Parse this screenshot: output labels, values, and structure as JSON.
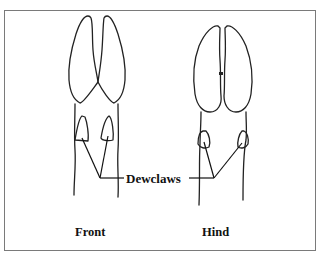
{
  "figure": {
    "callout_label": "Dewclaws",
    "panels": [
      {
        "id": "front",
        "label": "Front"
      },
      {
        "id": "hind",
        "label": "Hind"
      }
    ]
  },
  "colors": {
    "stroke": "#222222",
    "frame": "#7a7a7a",
    "background": "#ffffff"
  }
}
